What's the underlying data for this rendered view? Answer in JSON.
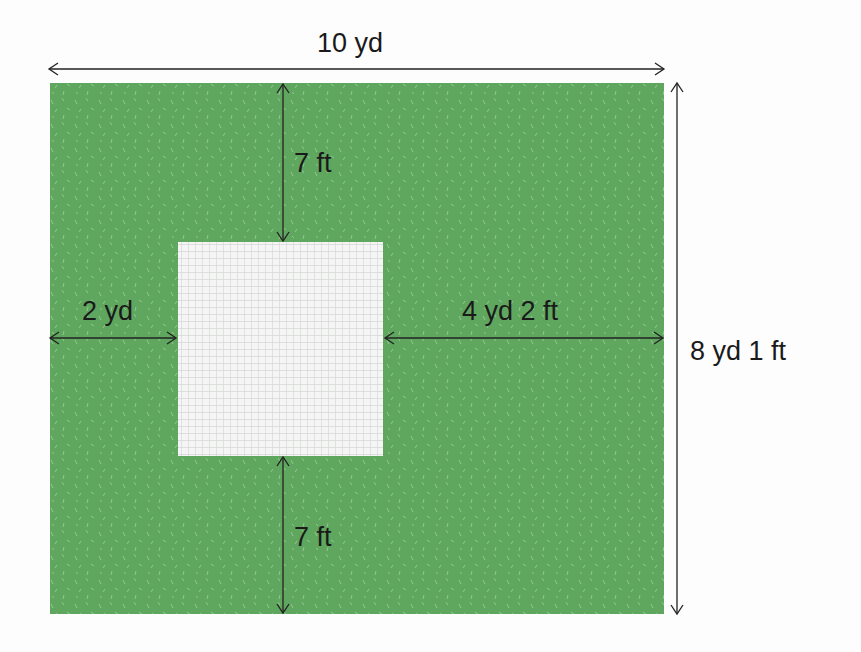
{
  "diagram": {
    "type": "area-diagram",
    "colors": {
      "lawn": "#5fa65f",
      "lawn_speckle": "#a8d3a0",
      "cutout": "#f4f5f4",
      "cutout_grid": "#d6d8d6",
      "lines": "#222222",
      "background": "#fdfdfd"
    },
    "outer": {
      "width_label": "10 yd",
      "height_label": "8 yd 1 ft"
    },
    "inner": {
      "top_gap_label": "7 ft",
      "bottom_gap_label": "7 ft",
      "left_gap_label": "2 yd",
      "right_gap_label": "4 yd 2 ft"
    }
  }
}
